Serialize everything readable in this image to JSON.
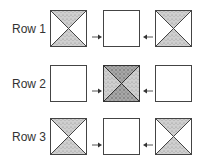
{
  "rows": [
    {
      "label": "Row 1",
      "boxes": [
        "hourglass",
        "empty",
        "hourglass"
      ]
    },
    {
      "label": "Row 2",
      "boxes": [
        "empty",
        "full",
        "empty"
      ]
    },
    {
      "label": "Row 3",
      "boxes": [
        "hourglass",
        "empty",
        "hourglass"
      ]
    }
  ],
  "colors": {
    "stroke": "#444444",
    "fill_light": "#c8c8c8",
    "fill_dark": "#9a9a9a",
    "arrow": "#555555",
    "label": "#333333"
  }
}
